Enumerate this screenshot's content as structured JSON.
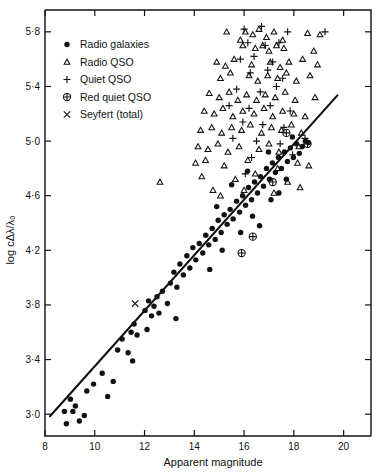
{
  "chart_data": {
    "type": "scatter",
    "title": "",
    "xlabel": "Apparent  magnitude",
    "ylabel": "log cΔλ/λ₀",
    "xlim": [
      8,
      21.1
    ],
    "ylim": [
      2.84,
      5.96
    ],
    "xticks": [
      8,
      10,
      12,
      14,
      16,
      18,
      20
    ],
    "xticklabels": [
      "8",
      "10",
      "12",
      "14",
      "16",
      "18",
      "20"
    ],
    "yticks": [
      3.0,
      3.4,
      3.8,
      4.2,
      4.6,
      5.0,
      5.4,
      5.8
    ],
    "yticklabels": [
      "3·0",
      "3·4",
      "3·8",
      "4·2",
      "4·6",
      "5·0",
      "5·4",
      "5·8"
    ],
    "grid": false,
    "legend_position": "upper-left",
    "fit_line": {
      "x": [
        8.2,
        19.75
      ],
      "y": [
        2.985,
        5.335
      ]
    },
    "series": [
      {
        "name": "Radio galaxies",
        "marker": "dot",
        "points": [
          [
            8.78,
            3.02
          ],
          [
            8.86,
            2.93
          ],
          [
            9.02,
            3.11
          ],
          [
            9.12,
            3.02
          ],
          [
            9.22,
            3.06
          ],
          [
            9.38,
            2.95
          ],
          [
            9.68,
            3.17
          ],
          [
            9.95,
            3.22
          ],
          [
            10.3,
            3.3
          ],
          [
            10.52,
            3.13
          ],
          [
            10.92,
            3.47
          ],
          [
            11.1,
            3.55
          ],
          [
            11.34,
            3.45
          ],
          [
            11.46,
            3.6
          ],
          [
            11.58,
            3.66
          ],
          [
            11.7,
            3.58
          ],
          [
            11.52,
            3.39
          ],
          [
            12.02,
            3.76
          ],
          [
            12.16,
            3.83
          ],
          [
            12.28,
            3.72
          ],
          [
            12.38,
            3.79
          ],
          [
            12.5,
            3.86
          ],
          [
            12.58,
            3.74
          ],
          [
            12.72,
            3.9
          ],
          [
            12.92,
            3.81
          ],
          [
            13.04,
            3.96
          ],
          [
            13.18,
            4.04
          ],
          [
            13.3,
            3.93
          ],
          [
            13.42,
            4.1
          ],
          [
            13.56,
            4.02
          ],
          [
            13.7,
            4.16
          ],
          [
            13.82,
            4.07
          ],
          [
            13.94,
            4.22
          ],
          [
            14.06,
            4.13
          ],
          [
            14.2,
            4.25
          ],
          [
            14.34,
            4.18
          ],
          [
            14.46,
            4.31
          ],
          [
            14.58,
            4.24
          ],
          [
            14.72,
            4.36
          ],
          [
            14.84,
            4.28
          ],
          [
            14.96,
            4.42
          ],
          [
            15.08,
            4.33
          ],
          [
            15.2,
            4.46
          ],
          [
            15.32,
            4.39
          ],
          [
            15.44,
            4.5
          ],
          [
            15.56,
            4.43
          ],
          [
            15.7,
            4.56
          ],
          [
            15.82,
            4.48
          ],
          [
            15.94,
            4.6
          ],
          [
            16.06,
            4.53
          ],
          [
            16.18,
            4.66
          ],
          [
            16.3,
            4.57
          ],
          [
            16.42,
            4.7
          ],
          [
            16.54,
            4.62
          ],
          [
            16.66,
            4.74
          ],
          [
            16.78,
            4.67
          ],
          [
            16.9,
            4.8
          ],
          [
            17.02,
            4.72
          ],
          [
            17.14,
            4.84
          ],
          [
            17.26,
            4.77
          ],
          [
            17.38,
            4.88
          ],
          [
            17.5,
            4.8
          ],
          [
            17.62,
            4.92
          ],
          [
            17.74,
            4.85
          ],
          [
            17.86,
            4.95
          ],
          [
            17.98,
            4.88
          ],
          [
            18.1,
            4.98
          ],
          [
            18.22,
            4.91
          ],
          [
            14.62,
            4.06
          ],
          [
            15.12,
            4.2
          ],
          [
            15.86,
            4.33
          ],
          [
            16.34,
            4.45
          ],
          [
            16.62,
            4.38
          ],
          [
            17.08,
            4.57
          ],
          [
            17.4,
            4.62
          ],
          [
            17.7,
            4.72
          ],
          [
            13.26,
            3.7
          ],
          [
            12.1,
            3.62
          ],
          [
            10.74,
            3.24
          ],
          [
            9.58,
            2.99
          ],
          [
            18.34,
            4.96
          ],
          [
            18.46,
            5.0
          ],
          [
            17.94,
            5.03
          ],
          [
            16.98,
            4.92
          ],
          [
            16.14,
            4.78
          ],
          [
            15.5,
            4.68
          ],
          [
            14.9,
            4.52
          ],
          [
            18.58,
            4.99
          ]
        ]
      },
      {
        "name": "Radio QSO",
        "marker": "triangle",
        "points": [
          [
            12.62,
            4.7
          ],
          [
            15.3,
            5.8
          ],
          [
            15.85,
            5.74
          ],
          [
            16.05,
            5.8
          ],
          [
            16.35,
            5.78
          ],
          [
            16.6,
            5.82
          ],
          [
            16.9,
            5.76
          ],
          [
            17.2,
            5.8
          ],
          [
            17.55,
            5.74
          ],
          [
            18.55,
            5.79
          ],
          [
            19.05,
            5.78
          ],
          [
            15.95,
            5.7
          ],
          [
            16.45,
            5.68
          ],
          [
            16.75,
            5.7
          ],
          [
            17.0,
            5.66
          ],
          [
            17.3,
            5.7
          ],
          [
            17.6,
            5.68
          ],
          [
            18.8,
            5.66
          ],
          [
            14.9,
            5.58
          ],
          [
            15.25,
            5.55
          ],
          [
            15.6,
            5.6
          ],
          [
            16.3,
            5.56
          ],
          [
            17.05,
            5.58
          ],
          [
            17.45,
            5.54
          ],
          [
            17.8,
            5.58
          ],
          [
            18.35,
            5.6
          ],
          [
            18.95,
            5.56
          ],
          [
            15.05,
            5.46
          ],
          [
            15.45,
            5.5
          ],
          [
            16.2,
            5.48
          ],
          [
            16.55,
            5.44
          ],
          [
            16.95,
            5.48
          ],
          [
            17.35,
            5.46
          ],
          [
            17.7,
            5.5
          ],
          [
            18.1,
            5.44
          ],
          [
            18.65,
            5.48
          ],
          [
            14.6,
            5.35
          ],
          [
            15.0,
            5.32
          ],
          [
            15.4,
            5.36
          ],
          [
            15.75,
            5.3
          ],
          [
            16.1,
            5.34
          ],
          [
            16.5,
            5.3
          ],
          [
            16.85,
            5.34
          ],
          [
            17.25,
            5.32
          ],
          [
            17.65,
            5.36
          ],
          [
            18.05,
            5.3
          ],
          [
            18.85,
            5.32
          ],
          [
            14.4,
            5.22
          ],
          [
            14.8,
            5.2
          ],
          [
            15.15,
            5.24
          ],
          [
            15.55,
            5.18
          ],
          [
            15.95,
            5.22
          ],
          [
            16.4,
            5.2
          ],
          [
            16.8,
            5.24
          ],
          [
            17.15,
            5.18
          ],
          [
            17.55,
            5.22
          ],
          [
            18.0,
            5.2
          ],
          [
            18.45,
            5.18
          ],
          [
            14.25,
            5.08
          ],
          [
            14.7,
            5.1
          ],
          [
            15.1,
            5.06
          ],
          [
            15.5,
            5.1
          ],
          [
            15.9,
            5.08
          ],
          [
            16.25,
            5.12
          ],
          [
            16.7,
            5.06
          ],
          [
            17.1,
            5.1
          ],
          [
            17.5,
            5.08
          ],
          [
            17.9,
            5.12
          ],
          [
            18.3,
            5.06
          ],
          [
            14.15,
            4.96
          ],
          [
            14.55,
            4.94
          ],
          [
            14.95,
            4.98
          ],
          [
            15.35,
            4.92
          ],
          [
            15.8,
            4.96
          ],
          [
            16.6,
            4.94
          ],
          [
            17.0,
            4.98
          ],
          [
            17.4,
            4.92
          ],
          [
            18.2,
            4.96
          ],
          [
            14.05,
            4.84
          ],
          [
            14.45,
            4.86
          ],
          [
            15.2,
            4.82
          ],
          [
            16.15,
            4.86
          ],
          [
            17.35,
            4.8
          ],
          [
            18.15,
            4.84
          ],
          [
            18.6,
            4.82
          ],
          [
            14.3,
            4.74
          ],
          [
            15.65,
            4.72
          ],
          [
            16.45,
            4.76
          ],
          [
            17.75,
            4.7
          ],
          [
            14.75,
            4.64
          ],
          [
            15.05,
            4.6
          ],
          [
            16.0,
            4.64
          ],
          [
            17.2,
            4.62
          ],
          [
            18.25,
            4.66
          ]
        ]
      },
      {
        "name": "Quiet QSO",
        "marker": "plus",
        "points": [
          [
            16.0,
            5.82
          ],
          [
            16.7,
            5.84
          ],
          [
            17.75,
            5.8
          ],
          [
            19.25,
            5.8
          ],
          [
            16.15,
            5.72
          ],
          [
            16.85,
            5.7
          ],
          [
            17.4,
            5.72
          ],
          [
            15.85,
            5.6
          ],
          [
            16.4,
            5.62
          ],
          [
            17.15,
            5.58
          ],
          [
            16.25,
            5.5
          ],
          [
            16.95,
            5.52
          ],
          [
            17.55,
            5.46
          ],
          [
            15.7,
            5.38
          ],
          [
            16.65,
            5.36
          ],
          [
            17.3,
            5.4
          ],
          [
            15.4,
            5.26
          ],
          [
            16.2,
            5.24
          ],
          [
            17.05,
            5.26
          ],
          [
            17.85,
            5.22
          ],
          [
            15.95,
            5.14
          ],
          [
            16.75,
            5.12
          ],
          [
            17.6,
            5.1
          ],
          [
            15.55,
            5.02
          ],
          [
            16.5,
            5.0
          ],
          [
            17.45,
            4.98
          ],
          [
            16.3,
            4.88
          ],
          [
            17.95,
            4.9
          ],
          [
            16.05,
            4.76
          ],
          [
            18.45,
            5.02
          ]
        ]
      },
      {
        "name": "Red quiet QSO",
        "marker": "circle-plus",
        "points": [
          [
            17.7,
            5.06
          ],
          [
            18.55,
            4.98
          ],
          [
            17.15,
            4.7
          ],
          [
            16.35,
            4.3
          ],
          [
            15.9,
            4.18
          ]
        ]
      },
      {
        "name": "Seyfert (total)",
        "marker": "cross",
        "points": [
          [
            11.62,
            3.81
          ]
        ]
      }
    ]
  },
  "legend": {
    "items": [
      {
        "label": "Radio galaxies",
        "marker": "dot"
      },
      {
        "label": "Radio QSO",
        "marker": "triangle"
      },
      {
        "label": "Quiet QSO",
        "marker": "plus"
      },
      {
        "label": "Red quiet QSO",
        "marker": "circle-plus"
      },
      {
        "label": "Seyfert (total)",
        "marker": "cross"
      }
    ]
  }
}
